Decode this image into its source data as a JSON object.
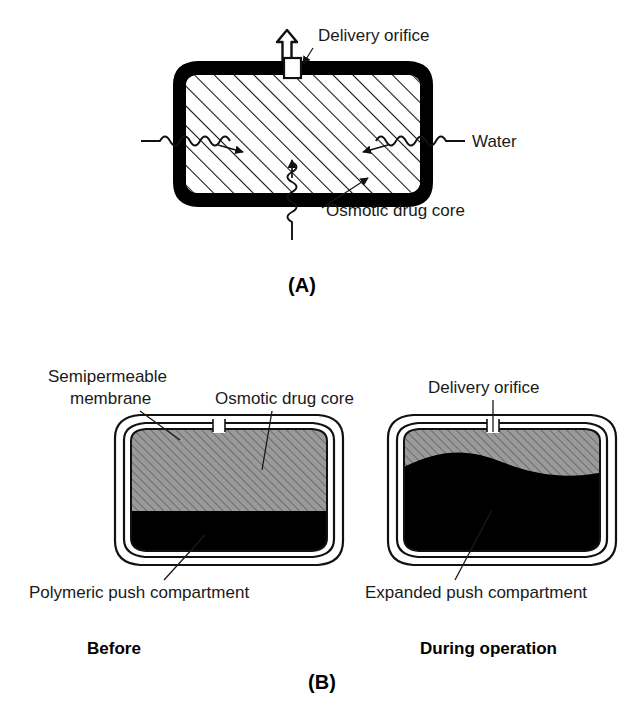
{
  "figure": {
    "background_color": "#ffffff",
    "ink_color": "#000000"
  },
  "panel_a": {
    "tag": "(A)",
    "labels": {
      "delivery_orifice": "Delivery orifice",
      "water": "Water",
      "osmotic_drug_core": "Osmotic drug core"
    },
    "capsule": {
      "wall_color": "#000000",
      "core_fill": "#ffffff",
      "hatch_color": "#000000",
      "wall_thickness_px": 13
    },
    "water_inflow_arrows": [
      {
        "side": "left",
        "direction": "inward"
      },
      {
        "side": "right",
        "direction": "inward"
      },
      {
        "side": "bottom",
        "direction": "inward"
      }
    ],
    "outflow_arrow": {
      "direction": "up",
      "style": "hollow-outline"
    }
  },
  "panel_b": {
    "tag": "(B)",
    "labels": {
      "semipermeable_membrane_line1": "Semipermeable",
      "semipermeable_membrane_line2": "membrane",
      "osmotic_drug_core": "Osmotic drug core",
      "delivery_orifice": "Delivery orifice",
      "polymeric_push_compartment": "Polymeric push compartment",
      "expanded_push_compartment": "Expanded push compartment"
    },
    "captions": {
      "before": "Before",
      "during": "During operation"
    },
    "left_capsule": {
      "state": "before",
      "drug_core_fill": "#9a9a9a",
      "push_compartment_fill": "#000000",
      "membrane_fill": "#ffffff",
      "drug_fraction_percent": 65,
      "push_fraction_percent": 35,
      "interface_shape": "flat"
    },
    "right_capsule": {
      "state": "during operation",
      "drug_core_fill": "#9a9a9a",
      "push_compartment_fill": "#000000",
      "membrane_fill": "#ffffff",
      "drug_fraction_percent": 28,
      "push_fraction_percent": 72,
      "interface_shape": "convex-upward"
    }
  }
}
